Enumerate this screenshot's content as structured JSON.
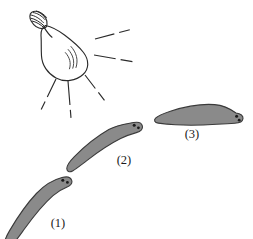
{
  "figure": {
    "background_color": "#ffffff",
    "width": 253,
    "height": 239
  },
  "light_source": {
    "name": "light-bulb",
    "type": "incandescent-bulb",
    "outline_color": "#2b2b2b",
    "glass_fill": "#ffffff",
    "base_hatch_count": 5,
    "filament_highlight_strokes": 3,
    "center": {
      "x": 66,
      "y": 48
    },
    "rays": [
      {
        "id": "ray-right-upper",
        "x1": 95,
        "y1": 39,
        "x2": 140,
        "y2": 27,
        "dash": "20 5 11"
      },
      {
        "id": "ray-right-lower",
        "x1": 94,
        "y1": 55,
        "x2": 140,
        "y2": 63,
        "dash": "22 5 12"
      },
      {
        "id": "ray-down-right",
        "x1": 85,
        "y1": 75,
        "x2": 108,
        "y2": 105,
        "dash": "17 5 10"
      },
      {
        "id": "ray-down-center",
        "x1": 68,
        "y1": 81,
        "x2": 71,
        "y2": 118,
        "dash": "24 5 8"
      },
      {
        "id": "ray-down-left",
        "x1": 56,
        "y1": 79,
        "x2": 41,
        "y2": 110,
        "dash": "20 5 9"
      }
    ]
  },
  "seals": [
    {
      "id": "seal-1",
      "label": "(1)",
      "label_position": {
        "x": 58,
        "y": 224
      },
      "fill_color": "#8a8a8a",
      "stroke_color": "#3a3a3a",
      "orientation_degrees": -62,
      "description": "body angled steeply up-right, head at upper right",
      "eyes": 2
    },
    {
      "id": "seal-2",
      "label": "(2)",
      "label_position": {
        "x": 124,
        "y": 161
      },
      "fill_color": "#8a8a8a",
      "stroke_color": "#3a3a3a",
      "orientation_degrees": -38,
      "description": "body angled moderately up-right, head at upper right",
      "eyes": 2
    },
    {
      "id": "seal-3",
      "label": "(3)",
      "label_position": {
        "x": 192,
        "y": 135
      },
      "fill_color": "#8a8a8a",
      "stroke_color": "#3a3a3a",
      "orientation_degrees": -8,
      "description": "body nearly horizontal, head at right",
      "eyes": 2
    }
  ]
}
